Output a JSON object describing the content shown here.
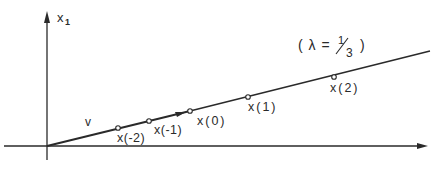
{
  "diagram": {
    "axis_y_label": "x",
    "axis_y_subscript": "1",
    "lambda_label": "( λ = 1/3 )",
    "lambda_open": "( λ =",
    "lambda_num": "1",
    "lambda_den": "3",
    "lambda_close": ")",
    "vector_label": "v",
    "points": [
      {
        "label": "x(-2)",
        "cx": 118,
        "cy": 128
      },
      {
        "label": "x(-1)",
        "cx": 149,
        "cy": 121
      },
      {
        "label": "x(0)",
        "cx": 190,
        "cy": 111
      },
      {
        "label": "x(1)",
        "cx": 248,
        "cy": 97
      },
      {
        "label": "x(2)",
        "cx": 334,
        "cy": 77
      }
    ],
    "colors": {
      "ink": "#2a2a2a",
      "background": "#ffffff"
    }
  }
}
